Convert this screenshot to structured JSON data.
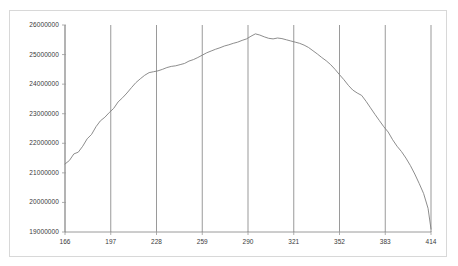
{
  "chart_data": {
    "type": "line",
    "title": "",
    "subtitle": "",
    "xlabel": "",
    "ylabel": "",
    "legend": [],
    "grid": {
      "vertical": true,
      "horizontal": false
    },
    "legend_position": "none",
    "xlim": [
      166,
      414
    ],
    "ylim": [
      19000000,
      26000000
    ],
    "yticks": [
      19000000,
      20000000,
      21000000,
      22000000,
      23000000,
      24000000,
      25000000,
      26000000
    ],
    "ytick_labels": [
      "19000000",
      "20000000",
      "21000000",
      "22000000",
      "23000000",
      "24000000",
      "25000000",
      "26000000"
    ],
    "xticks": [
      166,
      197,
      228,
      259,
      290,
      321,
      352,
      383,
      414
    ],
    "xtick_labels": [
      "166",
      "197",
      "228",
      "259",
      "290",
      "321",
      "352",
      "383",
      "414"
    ],
    "series": [
      {
        "name": "series-1",
        "color": "#808080",
        "x": [
          166,
          169,
          172,
          175,
          178,
          181,
          184,
          187,
          190,
          193,
          196,
          199,
          202,
          205,
          208,
          211,
          214,
          217,
          220,
          223,
          226,
          229,
          232,
          235,
          238,
          241,
          244,
          247,
          250,
          253,
          256,
          259,
          262,
          265,
          268,
          271,
          274,
          277,
          280,
          283,
          286,
          289,
          292,
          295,
          298,
          301,
          304,
          307,
          310,
          313,
          316,
          319,
          322,
          325,
          328,
          331,
          334,
          337,
          340,
          343,
          346,
          349,
          352,
          355,
          358,
          361,
          364,
          367,
          370,
          373,
          376,
          379,
          382,
          385,
          388,
          391,
          394,
          397,
          400,
          403,
          406,
          409,
          412,
          414
        ],
        "values": [
          21300000,
          21420000,
          21640000,
          21700000,
          21900000,
          22150000,
          22300000,
          22560000,
          22760000,
          22880000,
          23040000,
          23180000,
          23400000,
          23540000,
          23700000,
          23880000,
          24050000,
          24180000,
          24300000,
          24390000,
          24420000,
          24450000,
          24500000,
          24560000,
          24600000,
          24620000,
          24660000,
          24700000,
          24780000,
          24830000,
          24900000,
          24980000,
          25060000,
          25120000,
          25180000,
          25230000,
          25290000,
          25330000,
          25380000,
          25420000,
          25480000,
          25530000,
          25620000,
          25700000,
          25660000,
          25600000,
          25550000,
          25530000,
          25560000,
          25540000,
          25500000,
          25460000,
          25420000,
          25380000,
          25320000,
          25240000,
          25130000,
          25020000,
          24900000,
          24790000,
          24660000,
          24500000,
          24320000,
          24150000,
          23960000,
          23800000,
          23700000,
          23620000,
          23420000,
          23200000,
          22980000,
          22770000,
          22560000,
          22380000,
          22120000,
          21900000,
          21720000,
          21500000,
          21250000,
          20960000,
          20640000,
          20300000,
          19800000,
          19100000
        ]
      }
    ]
  },
  "axes": {
    "y_axis_name": "y-axis",
    "x_axis_name": "x-axis"
  }
}
